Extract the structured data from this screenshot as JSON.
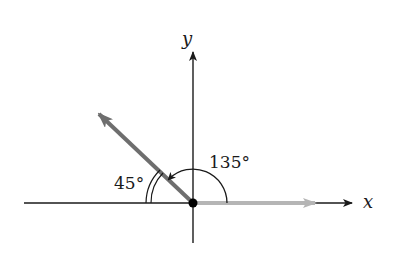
{
  "diagram": {
    "type": "angle-diagram",
    "axes": {
      "x_label": "x",
      "y_label": "y"
    },
    "origin": {
      "x": 193,
      "y": 203
    },
    "vectors": [
      {
        "name": "initial-side",
        "direction_deg": 0,
        "color": "#b5b5b5"
      },
      {
        "name": "terminal-side",
        "direction_deg": 135,
        "color": "#6e6e6e"
      }
    ],
    "angles": [
      {
        "label": "135°",
        "value_deg": 135,
        "description": "angle from positive x-axis to terminal side"
      },
      {
        "label": "45°",
        "value_deg": 45,
        "description": "reference angle between terminal side and negative x-axis"
      }
    ],
    "colors": {
      "axis": "#1a1a1a",
      "initial_side": "#b5b5b5",
      "terminal_side": "#6e6e6e",
      "origin_dot": "#000000"
    }
  }
}
